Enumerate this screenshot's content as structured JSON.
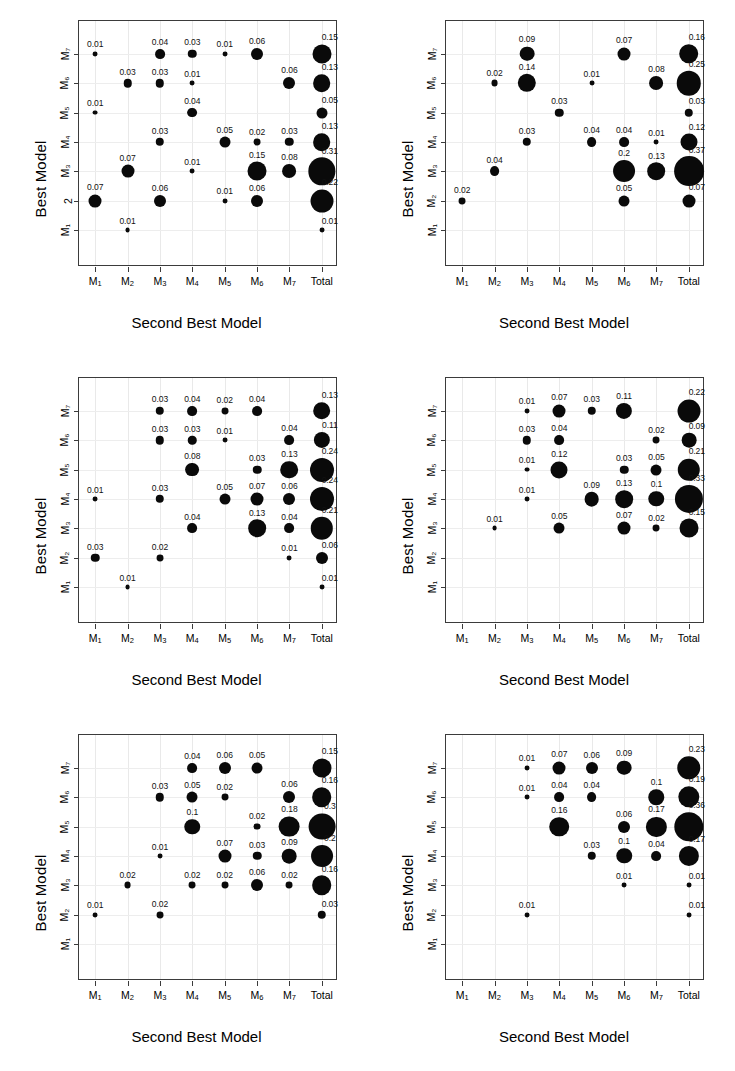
{
  "figure": {
    "panel_count": 6,
    "x_axis_title": "Second Best Model",
    "y_axis_title": "Best Model",
    "x_categories": [
      "M1",
      "M2",
      "M3",
      "M4",
      "M5",
      "M6",
      "M7",
      "Total"
    ],
    "x_tick_labels": [
      "M₁",
      "M₂",
      "M₃",
      "M₄",
      "M₅",
      "M₆",
      "M₇",
      "Total"
    ],
    "y_tick_labels": [
      "M₁",
      "M₂",
      "M₃",
      "M₄",
      "M₅",
      "M₆",
      "M₇"
    ],
    "y_tick_labels_panel1": [
      "M₁",
      "2",
      "M₃",
      "M₄",
      "M₅",
      "M₆",
      "M₇"
    ],
    "bubble_color": "#0a0a0a",
    "axis_color": "#3b3b3b",
    "grid_color": "#e9e9e9"
  },
  "chart_data": [
    {
      "type": "scatter",
      "panel": 1,
      "title": "",
      "xlabel": "Second Best Model",
      "ylabel": "Best Model",
      "x_categories": [
        "M1",
        "M2",
        "M3",
        "M4",
        "M5",
        "M6",
        "M7",
        "Total"
      ],
      "y_categories": [
        "M1",
        "M2",
        "M3",
        "M4",
        "M5",
        "M6",
        "M7"
      ],
      "points": [
        {
          "x": "M1",
          "y": "M7",
          "value": 0.01
        },
        {
          "x": "M3",
          "y": "M7",
          "value": 0.04
        },
        {
          "x": "M4",
          "y": "M7",
          "value": 0.03
        },
        {
          "x": "M5",
          "y": "M7",
          "value": 0.01
        },
        {
          "x": "M6",
          "y": "M7",
          "value": 0.06
        },
        {
          "x": "Total",
          "y": "M7",
          "value": 0.15
        },
        {
          "x": "M2",
          "y": "M6",
          "value": 0.03
        },
        {
          "x": "M3",
          "y": "M6",
          "value": 0.03
        },
        {
          "x": "M4",
          "y": "M6",
          "value": 0.01
        },
        {
          "x": "M7",
          "y": "M6",
          "value": 0.06
        },
        {
          "x": "Total",
          "y": "M6",
          "value": 0.13
        },
        {
          "x": "M1",
          "y": "M5",
          "value": 0.01
        },
        {
          "x": "M4",
          "y": "M5",
          "value": 0.04
        },
        {
          "x": "Total",
          "y": "M5",
          "value": 0.05
        },
        {
          "x": "M3",
          "y": "M4",
          "value": 0.03
        },
        {
          "x": "M5",
          "y": "M4",
          "value": 0.05
        },
        {
          "x": "M6",
          "y": "M4",
          "value": 0.02
        },
        {
          "x": "M7",
          "y": "M4",
          "value": 0.03
        },
        {
          "x": "Total",
          "y": "M4",
          "value": 0.13
        },
        {
          "x": "M2",
          "y": "M3",
          "value": 0.07
        },
        {
          "x": "M4",
          "y": "M3",
          "value": 0.01
        },
        {
          "x": "M6",
          "y": "M3",
          "value": 0.15
        },
        {
          "x": "M7",
          "y": "M3",
          "value": 0.08
        },
        {
          "x": "Total",
          "y": "M3",
          "value": 0.31
        },
        {
          "x": "M1",
          "y": "M2",
          "value": 0.07
        },
        {
          "x": "M3",
          "y": "M2",
          "value": 0.06
        },
        {
          "x": "M5",
          "y": "M2",
          "value": 0.01
        },
        {
          "x": "M6",
          "y": "M2",
          "value": 0.06
        },
        {
          "x": "Total",
          "y": "M2",
          "value": 0.22
        },
        {
          "x": "M2",
          "y": "M1",
          "value": 0.01
        },
        {
          "x": "Total",
          "y": "M1",
          "value": 0.01
        }
      ]
    },
    {
      "type": "scatter",
      "panel": 2,
      "title": "",
      "xlabel": "Second Best Model",
      "ylabel": "Best Model",
      "x_categories": [
        "M1",
        "M2",
        "M3",
        "M4",
        "M5",
        "M6",
        "M7",
        "Total"
      ],
      "y_categories": [
        "M1",
        "M2",
        "M3",
        "M4",
        "M5",
        "M6",
        "M7"
      ],
      "points": [
        {
          "x": "M3",
          "y": "M7",
          "value": 0.09
        },
        {
          "x": "M6",
          "y": "M7",
          "value": 0.07
        },
        {
          "x": "Total",
          "y": "M7",
          "value": 0.16
        },
        {
          "x": "M2",
          "y": "M6",
          "value": 0.02
        },
        {
          "x": "M3",
          "y": "M6",
          "value": 0.14
        },
        {
          "x": "M5",
          "y": "M6",
          "value": 0.01
        },
        {
          "x": "M7",
          "y": "M6",
          "value": 0.08
        },
        {
          "x": "Total",
          "y": "M6",
          "value": 0.25
        },
        {
          "x": "M4",
          "y": "M5",
          "value": 0.03
        },
        {
          "x": "Total",
          "y": "M5",
          "value": 0.03
        },
        {
          "x": "M3",
          "y": "M4",
          "value": 0.03
        },
        {
          "x": "M5",
          "y": "M4",
          "value": 0.04
        },
        {
          "x": "M6",
          "y": "M4",
          "value": 0.04
        },
        {
          "x": "M7",
          "y": "M4",
          "value": 0.01
        },
        {
          "x": "Total",
          "y": "M4",
          "value": 0.12
        },
        {
          "x": "M2",
          "y": "M3",
          "value": 0.04
        },
        {
          "x": "M6",
          "y": "M3",
          "value": 0.2
        },
        {
          "x": "M7",
          "y": "M3",
          "value": 0.13
        },
        {
          "x": "Total",
          "y": "M3",
          "value": 0.37
        },
        {
          "x": "M1",
          "y": "M2",
          "value": 0.02
        },
        {
          "x": "M6",
          "y": "M2",
          "value": 0.05
        },
        {
          "x": "Total",
          "y": "M2",
          "value": 0.07
        }
      ]
    },
    {
      "type": "scatter",
      "panel": 3,
      "title": "",
      "xlabel": "Second Best Model",
      "ylabel": "Best Model",
      "x_categories": [
        "M1",
        "M2",
        "M3",
        "M4",
        "M5",
        "M6",
        "M7",
        "Total"
      ],
      "y_categories": [
        "M1",
        "M2",
        "M3",
        "M4",
        "M5",
        "M6",
        "M7"
      ],
      "points": [
        {
          "x": "M3",
          "y": "M7",
          "value": 0.03
        },
        {
          "x": "M4",
          "y": "M7",
          "value": 0.04
        },
        {
          "x": "M5",
          "y": "M7",
          "value": 0.02
        },
        {
          "x": "M6",
          "y": "M7",
          "value": 0.04
        },
        {
          "x": "Total",
          "y": "M7",
          "value": 0.13
        },
        {
          "x": "M3",
          "y": "M6",
          "value": 0.03
        },
        {
          "x": "M4",
          "y": "M6",
          "value": 0.03
        },
        {
          "x": "M5",
          "y": "M6",
          "value": 0.01
        },
        {
          "x": "M7",
          "y": "M6",
          "value": 0.04
        },
        {
          "x": "Total",
          "y": "M6",
          "value": 0.11
        },
        {
          "x": "M4",
          "y": "M5",
          "value": 0.08
        },
        {
          "x": "M6",
          "y": "M5",
          "value": 0.03
        },
        {
          "x": "M7",
          "y": "M5",
          "value": 0.13
        },
        {
          "x": "Total",
          "y": "M5",
          "value": 0.24
        },
        {
          "x": "M1",
          "y": "M4",
          "value": 0.01
        },
        {
          "x": "M3",
          "y": "M4",
          "value": 0.03
        },
        {
          "x": "M5",
          "y": "M4",
          "value": 0.05
        },
        {
          "x": "M6",
          "y": "M4",
          "value": 0.07
        },
        {
          "x": "M7",
          "y": "M4",
          "value": 0.06
        },
        {
          "x": "Total",
          "y": "M4",
          "value": 0.24
        },
        {
          "x": "M4",
          "y": "M3",
          "value": 0.04
        },
        {
          "x": "M6",
          "y": "M3",
          "value": 0.13
        },
        {
          "x": "M7",
          "y": "M3",
          "value": 0.04
        },
        {
          "x": "Total",
          "y": "M3",
          "value": 0.21
        },
        {
          "x": "M1",
          "y": "M2",
          "value": 0.03
        },
        {
          "x": "M3",
          "y": "M2",
          "value": 0.02
        },
        {
          "x": "M7",
          "y": "M2",
          "value": 0.01
        },
        {
          "x": "Total",
          "y": "M2",
          "value": 0.06
        },
        {
          "x": "M2",
          "y": "M1",
          "value": 0.01
        },
        {
          "x": "Total",
          "y": "M1",
          "value": 0.01
        }
      ]
    },
    {
      "type": "scatter",
      "panel": 4,
      "title": "",
      "xlabel": "Second Best Model",
      "ylabel": "Best Model",
      "x_categories": [
        "M1",
        "M2",
        "M3",
        "M4",
        "M5",
        "M6",
        "M7",
        "Total"
      ],
      "y_categories": [
        "M1",
        "M2",
        "M3",
        "M4",
        "M5",
        "M6",
        "M7"
      ],
      "points": [
        {
          "x": "M3",
          "y": "M7",
          "value": 0.01
        },
        {
          "x": "M4",
          "y": "M7",
          "value": 0.07
        },
        {
          "x": "M5",
          "y": "M7",
          "value": 0.03
        },
        {
          "x": "M6",
          "y": "M7",
          "value": 0.11
        },
        {
          "x": "Total",
          "y": "M7",
          "value": 0.22
        },
        {
          "x": "M3",
          "y": "M6",
          "value": 0.03
        },
        {
          "x": "M4",
          "y": "M6",
          "value": 0.04
        },
        {
          "x": "M7",
          "y": "M6",
          "value": 0.02
        },
        {
          "x": "Total",
          "y": "M6",
          "value": 0.09
        },
        {
          "x": "M3",
          "y": "M5",
          "value": 0.01
        },
        {
          "x": "M4",
          "y": "M5",
          "value": 0.12
        },
        {
          "x": "M6",
          "y": "M5",
          "value": 0.03
        },
        {
          "x": "M7",
          "y": "M5",
          "value": 0.05
        },
        {
          "x": "Total",
          "y": "M5",
          "value": 0.21
        },
        {
          "x": "M3",
          "y": "M4",
          "value": 0.01
        },
        {
          "x": "M5",
          "y": "M4",
          "value": 0.09
        },
        {
          "x": "M6",
          "y": "M4",
          "value": 0.13
        },
        {
          "x": "M7",
          "y": "M4",
          "value": 0.1
        },
        {
          "x": "Total",
          "y": "M4",
          "value": 0.33
        },
        {
          "x": "M2",
          "y": "M3",
          "value": 0.01
        },
        {
          "x": "M4",
          "y": "M3",
          "value": 0.05
        },
        {
          "x": "M6",
          "y": "M3",
          "value": 0.07
        },
        {
          "x": "M7",
          "y": "M3",
          "value": 0.02
        },
        {
          "x": "Total",
          "y": "M3",
          "value": 0.15
        }
      ]
    },
    {
      "type": "scatter",
      "panel": 5,
      "title": "",
      "xlabel": "Second Best Model",
      "ylabel": "Best Model",
      "x_categories": [
        "M1",
        "M2",
        "M3",
        "M4",
        "M5",
        "M6",
        "M7",
        "Total"
      ],
      "y_categories": [
        "M1",
        "M2",
        "M3",
        "M4",
        "M5",
        "M6",
        "M7"
      ],
      "points": [
        {
          "x": "M4",
          "y": "M7",
          "value": 0.04
        },
        {
          "x": "M5",
          "y": "M7",
          "value": 0.06
        },
        {
          "x": "M6",
          "y": "M7",
          "value": 0.05
        },
        {
          "x": "Total",
          "y": "M7",
          "value": 0.15
        },
        {
          "x": "M3",
          "y": "M6",
          "value": 0.03
        },
        {
          "x": "M4",
          "y": "M6",
          "value": 0.05
        },
        {
          "x": "M5",
          "y": "M6",
          "value": 0.02
        },
        {
          "x": "M7",
          "y": "M6",
          "value": 0.06
        },
        {
          "x": "Total",
          "y": "M6",
          "value": 0.16
        },
        {
          "x": "M4",
          "y": "M5",
          "value": 0.1
        },
        {
          "x": "M6",
          "y": "M5",
          "value": 0.02
        },
        {
          "x": "M7",
          "y": "M5",
          "value": 0.18
        },
        {
          "x": "Total",
          "y": "M5",
          "value": 0.3
        },
        {
          "x": "M3",
          "y": "M4",
          "value": 0.01
        },
        {
          "x": "M5",
          "y": "M4",
          "value": 0.07
        },
        {
          "x": "M6",
          "y": "M4",
          "value": 0.03
        },
        {
          "x": "M7",
          "y": "M4",
          "value": 0.09
        },
        {
          "x": "Total",
          "y": "M4",
          "value": 0.2
        },
        {
          "x": "M2",
          "y": "M3",
          "value": 0.02
        },
        {
          "x": "M4",
          "y": "M3",
          "value": 0.02
        },
        {
          "x": "M5",
          "y": "M3",
          "value": 0.02
        },
        {
          "x": "M6",
          "y": "M3",
          "value": 0.06
        },
        {
          "x": "M7",
          "y": "M3",
          "value": 0.02
        },
        {
          "x": "Total",
          "y": "M3",
          "value": 0.16
        },
        {
          "x": "M1",
          "y": "M2",
          "value": 0.01
        },
        {
          "x": "M3",
          "y": "M2",
          "value": 0.02
        },
        {
          "x": "Total",
          "y": "M2",
          "value": 0.03
        }
      ]
    },
    {
      "type": "scatter",
      "panel": 6,
      "title": "",
      "xlabel": "Second Best Model",
      "ylabel": "Best Model",
      "x_categories": [
        "M1",
        "M2",
        "M3",
        "M4",
        "M5",
        "M6",
        "M7",
        "Total"
      ],
      "y_categories": [
        "M1",
        "M2",
        "M3",
        "M4",
        "M5",
        "M6",
        "M7"
      ],
      "points": [
        {
          "x": "M3",
          "y": "M7",
          "value": 0.01
        },
        {
          "x": "M4",
          "y": "M7",
          "value": 0.07
        },
        {
          "x": "M5",
          "y": "M7",
          "value": 0.06
        },
        {
          "x": "M6",
          "y": "M7",
          "value": 0.09
        },
        {
          "x": "Total",
          "y": "M7",
          "value": 0.23
        },
        {
          "x": "M3",
          "y": "M6",
          "value": 0.01
        },
        {
          "x": "M4",
          "y": "M6",
          "value": 0.04
        },
        {
          "x": "M5",
          "y": "M6",
          "value": 0.04
        },
        {
          "x": "M7",
          "y": "M6",
          "value": 0.1
        },
        {
          "x": "Total",
          "y": "M6",
          "value": 0.19
        },
        {
          "x": "M4",
          "y": "M5",
          "value": 0.16
        },
        {
          "x": "M6",
          "y": "M5",
          "value": 0.06
        },
        {
          "x": "M7",
          "y": "M5",
          "value": 0.17
        },
        {
          "x": "Total",
          "y": "M5",
          "value": 0.36
        },
        {
          "x": "M5",
          "y": "M4",
          "value": 0.03
        },
        {
          "x": "M6",
          "y": "M4",
          "value": 0.1
        },
        {
          "x": "M7",
          "y": "M4",
          "value": 0.04
        },
        {
          "x": "Total",
          "y": "M4",
          "value": 0.17
        },
        {
          "x": "M6",
          "y": "M3",
          "value": 0.01
        },
        {
          "x": "Total",
          "y": "M3",
          "value": 0.01
        },
        {
          "x": "M3",
          "y": "M2",
          "value": 0.01
        },
        {
          "x": "Total",
          "y": "M2",
          "value": 0.01
        }
      ]
    }
  ]
}
